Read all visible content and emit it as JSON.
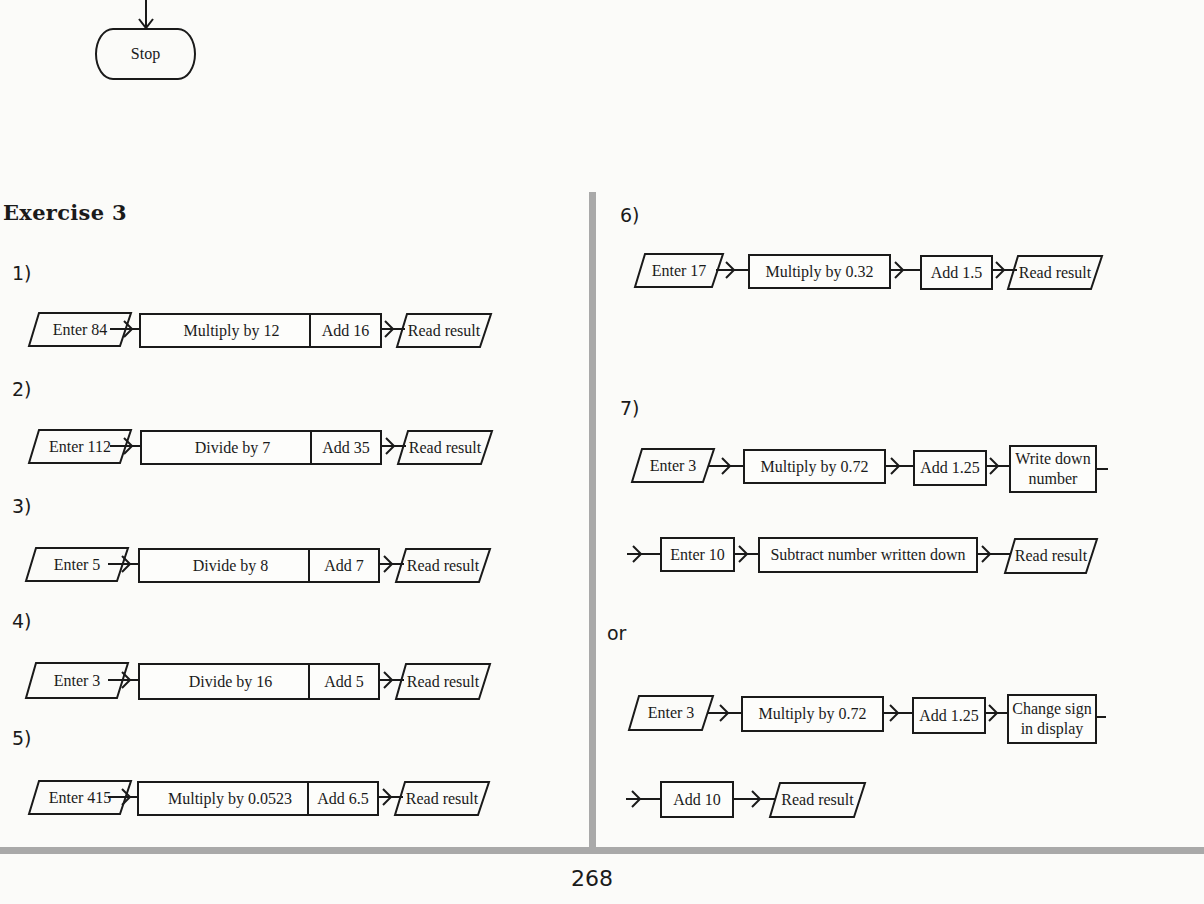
{
  "top_flow": {
    "terminal_label": "Stop"
  },
  "exercise": {
    "title": "Exercise 3"
  },
  "problems": [
    {
      "number": "1)",
      "steps": [
        "Enter 84",
        "Multiply by 12",
        "Add 16",
        "Read result"
      ]
    },
    {
      "number": "2)",
      "steps": [
        "Enter 112",
        "Divide by 7",
        "Add 35",
        "Read result"
      ]
    },
    {
      "number": "3)",
      "steps": [
        "Enter 5",
        "Divide by 8",
        "Add 7",
        "Read result"
      ]
    },
    {
      "number": "4)",
      "steps": [
        "Enter 3",
        "Divide by 16",
        "Add 5",
        "Read result"
      ]
    },
    {
      "number": "5)",
      "steps": [
        "Enter 415",
        "Multiply by 0.0523",
        "Add 6.5",
        "Read result"
      ]
    },
    {
      "number": "6)",
      "steps": [
        "Enter 17",
        "Multiply by 0.32",
        "Add 1.5",
        "Read result"
      ]
    },
    {
      "number": "7)",
      "row1": [
        "Enter 3",
        "Multiply by 0.72",
        "Add 1.25",
        "Write down",
        "number"
      ],
      "row2": [
        "Enter 10",
        "Subtract number written down",
        "Read result"
      ]
    }
  ],
  "alternative": {
    "label": "or",
    "row1": [
      "Enter 3",
      "Multiply by 0.72",
      "Add 1.25",
      "Change sign",
      "in display"
    ],
    "row2": [
      "Add 10",
      "Read result"
    ]
  },
  "footer": {
    "page_number": "268"
  },
  "colors": {
    "ink": "#1a1a1a",
    "paper": "#fbfbf9",
    "rule": "#a9a9a9"
  }
}
